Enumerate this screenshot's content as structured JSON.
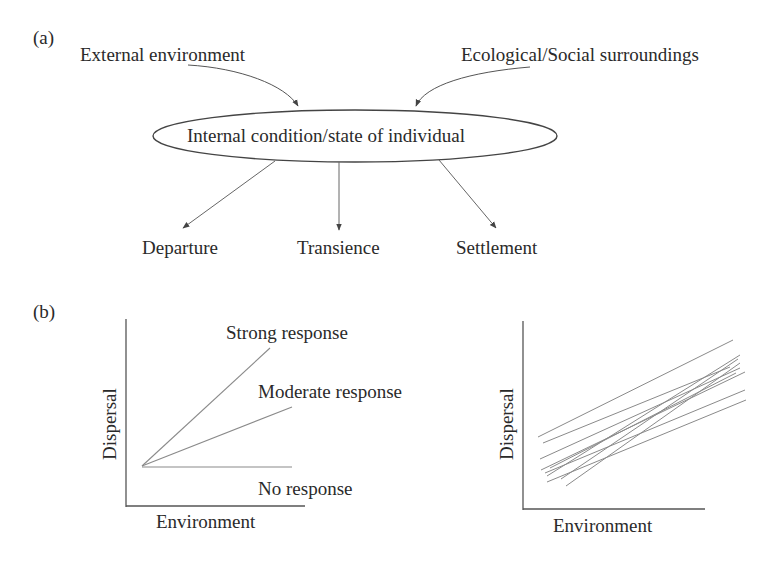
{
  "panel_a": {
    "label": "(a)",
    "inputs": {
      "left": "External environment",
      "right": "Ecological/Social surroundings"
    },
    "center_node": "Internal condition/state of individual",
    "outputs": [
      "Departure",
      "Transience",
      "Settlement"
    ]
  },
  "panel_b": {
    "label": "(b)",
    "left_plot": {
      "ylabel": "Dispersal",
      "xlabel": "Environment",
      "lines": [
        {
          "name": "Strong response"
        },
        {
          "name": "Moderate response"
        },
        {
          "name": "No response"
        }
      ]
    },
    "right_plot": {
      "ylabel": "Dispersal",
      "xlabel": "Environment",
      "description": "Multiple individual reaction norms"
    }
  },
  "colors": {
    "text": "#2a2a2a",
    "line": "#8a8a8a",
    "axis": "#555555"
  }
}
